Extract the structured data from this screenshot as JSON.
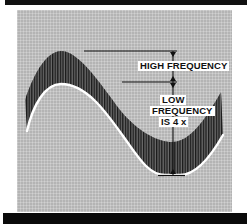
{
  "diagram": {
    "labels": {
      "high_frequency": "HIGH FREQUENCY",
      "low_line1": "LOW",
      "low_line2": "FREQUENCY",
      "low_line3": "IS 4 x"
    },
    "colors": {
      "panel": "#b4b4b4",
      "hatch": "#1a1a1a",
      "curve": "#ffffff",
      "bars": "#0a0a0a",
      "label_bg": "#ffffff"
    }
  }
}
